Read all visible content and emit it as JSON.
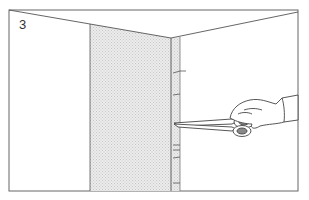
{
  "illustration": {
    "step_number": "3",
    "subject": "hand trimming wallpaper at inside room corner with scissors",
    "colors": {
      "line": "#555555",
      "wallpaper_shade": "#d9d9d9",
      "background": "#ffffff"
    }
  }
}
